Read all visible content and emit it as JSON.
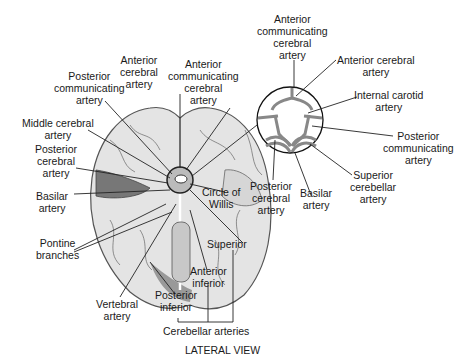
{
  "figure": {
    "caption": "LATERAL VIEW",
    "brain_labels": {
      "anterior_cerebral": "Anterior\ncerebral\nartery",
      "anterior_communicating": "Anterior\ncommunicating\ncerebral\nartery",
      "posterior_communicating": "Posterior\ncommunicating\nartery",
      "middle_cerebral": "Middle cerebral\nartery",
      "posterior_cerebral": "Posterior\ncerebral\nartery",
      "circle_of_willis": "Circle of\nWillis",
      "basilar": "Basilar\nartery",
      "pontine": "Pontine\nbranches",
      "vertebral": "Vertebral\nartery",
      "superior": "Superior",
      "anterior_inferior": "Anterior\ninferior",
      "posterior_inferior": "Posterior\ninferior",
      "cerebellar_group": "Cerebellar arteries"
    },
    "inset_labels": {
      "anterior_communicating": "Anterior\ncommunicating\ncerebral\nartery",
      "anterior_cerebral": "Anterior cerebral\nartery",
      "internal_carotid": "Internal carotid\nartery",
      "posterior_communicating": "Posterior\ncommunicating\nartery",
      "superior_cerebellar": "Superior\ncerebellar\nartery",
      "basilar": "Basilar\nartery",
      "posterior_cerebral": "Posterior\ncerebral\nartery"
    }
  }
}
